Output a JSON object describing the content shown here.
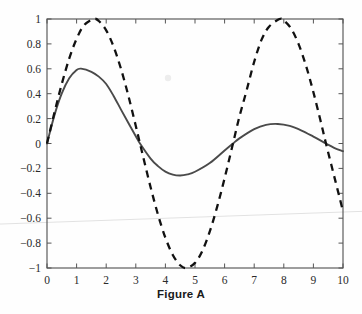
{
  "figure": {
    "caption": "Figure A",
    "background_color": "#fefefe"
  },
  "chart_data": {
    "type": "line",
    "title": "Figure A",
    "xlabel": "",
    "ylabel": "",
    "xlim": [
      0,
      10
    ],
    "ylim": [
      -1,
      1
    ],
    "grid": false,
    "legend": null,
    "frame": "box",
    "tick_direction": "in",
    "x_ticks": [
      0,
      1,
      2,
      3,
      4,
      5,
      6,
      7,
      8,
      9,
      10
    ],
    "x_tick_labels": [
      "0",
      "1",
      "2",
      "3",
      "4",
      "5",
      "6",
      "7",
      "8",
      "9",
      "10"
    ],
    "y_ticks": [
      -1,
      -0.8,
      -0.6,
      -0.4,
      -0.2,
      0,
      0.2,
      0.4,
      0.6,
      0.8,
      1
    ],
    "y_tick_labels": [
      "−1",
      "−0.8",
      "−0.6",
      "−0.4",
      "−0.2",
      "0",
      "0.2",
      "0.4",
      "0.6",
      "0.8",
      "1"
    ],
    "series": [
      {
        "name": "sine",
        "style": "dashed",
        "color": "#111111",
        "x": [
          0,
          0.25,
          0.5,
          0.75,
          1,
          1.25,
          1.5708,
          1.75,
          2,
          2.25,
          2.5,
          2.75,
          3,
          3.1416,
          3.25,
          3.5,
          3.75,
          4,
          4.25,
          4.5,
          4.7124,
          5,
          5.25,
          5.5,
          5.75,
          6,
          6.2832,
          6.5,
          6.75,
          7,
          7.25,
          7.5,
          7.854,
          8,
          8.25,
          8.5,
          8.75,
          9,
          9.25,
          9.4248,
          9.75,
          10
        ],
        "y": [
          0,
          0.247,
          0.479,
          0.682,
          0.841,
          0.949,
          1,
          0.984,
          0.909,
          0.778,
          0.599,
          0.382,
          0.141,
          0,
          -0.108,
          -0.351,
          -0.572,
          -0.757,
          -0.895,
          -0.978,
          -1,
          -0.959,
          -0.861,
          -0.706,
          -0.507,
          -0.279,
          0,
          0.215,
          0.432,
          0.657,
          0.834,
          0.938,
          1,
          0.989,
          0.922,
          0.798,
          0.625,
          0.412,
          0.174,
          0,
          -0.308,
          -0.544
        ]
      },
      {
        "name": "damped-sine",
        "style": "solid",
        "color": "#4a4a4a",
        "x": [
          0,
          0.25,
          0.5,
          0.75,
          1,
          1.15,
          1.5,
          1.75,
          2,
          2.25,
          2.5,
          2.75,
          3,
          3.1416,
          3.5,
          3.75,
          4,
          4.25,
          4.5,
          4.75,
          5,
          5.5,
          6,
          6.2832,
          6.5,
          7,
          7.4,
          7.8,
          8.2,
          8.6,
          9,
          9.4248,
          9.7,
          10
        ],
        "y": [
          0,
          0.226,
          0.402,
          0.524,
          0.591,
          0.601,
          0.576,
          0.537,
          0.478,
          0.382,
          0.272,
          0.164,
          0.058,
          0,
          -0.121,
          -0.182,
          -0.226,
          -0.25,
          -0.257,
          -0.248,
          -0.227,
          -0.157,
          -0.056,
          0,
          0.041,
          0.115,
          0.15,
          0.157,
          0.141,
          0.104,
          0.055,
          0,
          -0.035,
          -0.062
        ]
      }
    ],
    "annotations": [
      {
        "type": "scan-fold-line",
        "color": "#e2e2e2",
        "from": [
          0,
          -0.647
        ],
        "to": [
          10,
          -0.545
        ]
      },
      {
        "type": "scan-speck",
        "color": "#ededed",
        "at": [
          4.08,
          0.53
        ]
      }
    ]
  }
}
